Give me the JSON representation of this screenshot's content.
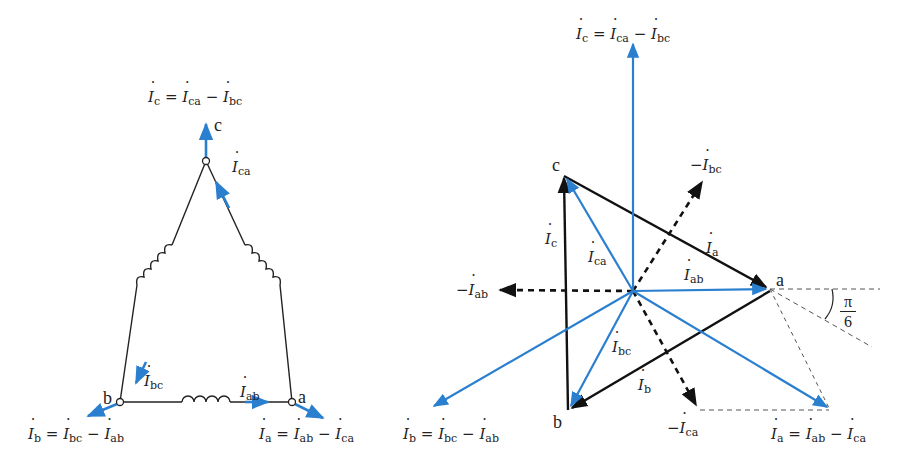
{
  "figure": {
    "left_diagram": {
      "title": "Delta-connected three-phase load",
      "nodes": {
        "a": "a",
        "b": "b",
        "c": "c"
      },
      "labels": {
        "Ic_eq": {
          "lhs": "c",
          "op": "=",
          "t1": "ca",
          "minus": "−",
          "t2": "bc"
        },
        "Ib_eq": {
          "lhs": "b",
          "op": "=",
          "t1": "bc",
          "minus": "−",
          "t2": "ab"
        },
        "Ia_eq": {
          "lhs": "a",
          "op": "=",
          "t1": "ab",
          "minus": "−",
          "t2": "ca"
        },
        "Ica": "ca",
        "Ibc": "bc",
        "Iab": "ab"
      },
      "colors": {
        "arrow": "#2a7fcf",
        "wire": "#222222"
      }
    },
    "right_diagram": {
      "title": "Phasor diagram of line and phase currents",
      "nodes": {
        "a": "a",
        "b": "b",
        "c": "c"
      },
      "labels": {
        "Ic_top_eq": {
          "lhs": "c",
          "op": "=",
          "t1": "ca",
          "minus": "−",
          "t2": "bc"
        },
        "Ib_eq": {
          "lhs": "b",
          "op": "=",
          "t1": "bc",
          "minus": "−",
          "t2": "ab"
        },
        "Ia_eq": {
          "lhs": "a",
          "op": "=",
          "t1": "ab",
          "minus": "−",
          "t2": "ca"
        },
        "neg_Ibc": {
          "minus": "−",
          "sub": "bc"
        },
        "neg_Iab": {
          "minus": "−",
          "sub": "ab"
        },
        "neg_Ica": {
          "minus": "−",
          "sub": "ca"
        },
        "Ic": "c",
        "Ica": "ca",
        "Ia": "a",
        "Iab": "ab",
        "Ibc": "bc",
        "Ib": "b"
      },
      "angle": {
        "numerator": "π",
        "denominator": "6"
      },
      "colors": {
        "phase": "#2a7fcf",
        "line": "#111111",
        "dashed": "#555555"
      }
    }
  }
}
